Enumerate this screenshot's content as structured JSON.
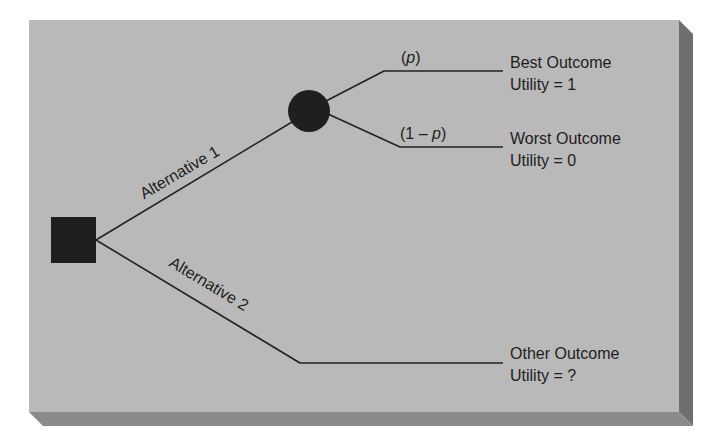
{
  "diagram": {
    "type": "decision-tree",
    "colors": {
      "panel": "#b9b9b9",
      "shadow": "#6f6f6f",
      "shadow_bottom": "#8a8a8a",
      "node": "#1f1f1f",
      "line": "#222222",
      "text": "#1e1e1e"
    },
    "decision_node": {
      "shape": "square",
      "label": ""
    },
    "chance_node": {
      "shape": "circle",
      "label": ""
    },
    "alternatives": [
      {
        "label": "Alternative 1"
      },
      {
        "label": "Alternative 2"
      }
    ],
    "branches": {
      "upper": {
        "probability_open": "(",
        "probability_var": "p",
        "probability_close": ")"
      },
      "lower": {
        "probability_open": "(1 – ",
        "probability_var": "p",
        "probability_close": ")"
      }
    },
    "outcomes": [
      {
        "name": "Best Outcome",
        "utility": "Utility = 1"
      },
      {
        "name": "Worst Outcome",
        "utility": "Utility = 0"
      },
      {
        "name": "Other Outcome",
        "utility": "Utility = ?"
      }
    ]
  }
}
